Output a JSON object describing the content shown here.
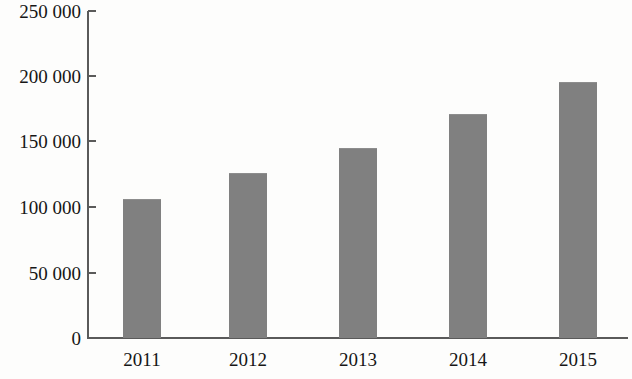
{
  "chart_data": {
    "type": "bar",
    "title": "",
    "subtitle": "",
    "xlabel": "",
    "ylabel": "",
    "categories": [
      "2011",
      "2012",
      "2013",
      "2014",
      "2015"
    ],
    "values": [
      106000,
      126000,
      145000,
      171000,
      196000
    ],
    "ylim": [
      0,
      250000
    ],
    "y_ticks": [
      0,
      50000,
      100000,
      150000,
      200000,
      250000
    ],
    "y_tick_labels": [
      "0",
      "50 000",
      "100 000",
      "150 000",
      "200 000",
      "250 000"
    ],
    "grid": false,
    "legend": null,
    "series": [
      {
        "name": "",
        "values": [
          106000,
          126000,
          145000,
          171000,
          196000
        ]
      }
    ],
    "colors": {
      "bar_fill": "#808080",
      "bar_edge": "#8d8d8d",
      "axis": "#5a5a5a",
      "text": "#161616",
      "background": "#fdfdfc"
    }
  },
  "axis": {
    "y_labels": [
      {
        "text": "250 000",
        "value": 250000
      },
      {
        "text": "200 000",
        "value": 200000
      },
      {
        "text": "150 000",
        "value": 150000
      },
      {
        "text": "100 000",
        "value": 100000
      },
      {
        "text": "50 000",
        "value": 50000
      },
      {
        "text": "0",
        "value": 0
      }
    ],
    "x_labels": [
      {
        "text": "2011"
      },
      {
        "text": "2012"
      },
      {
        "text": "2013"
      },
      {
        "text": "2014"
      },
      {
        "text": "2015"
      }
    ]
  }
}
